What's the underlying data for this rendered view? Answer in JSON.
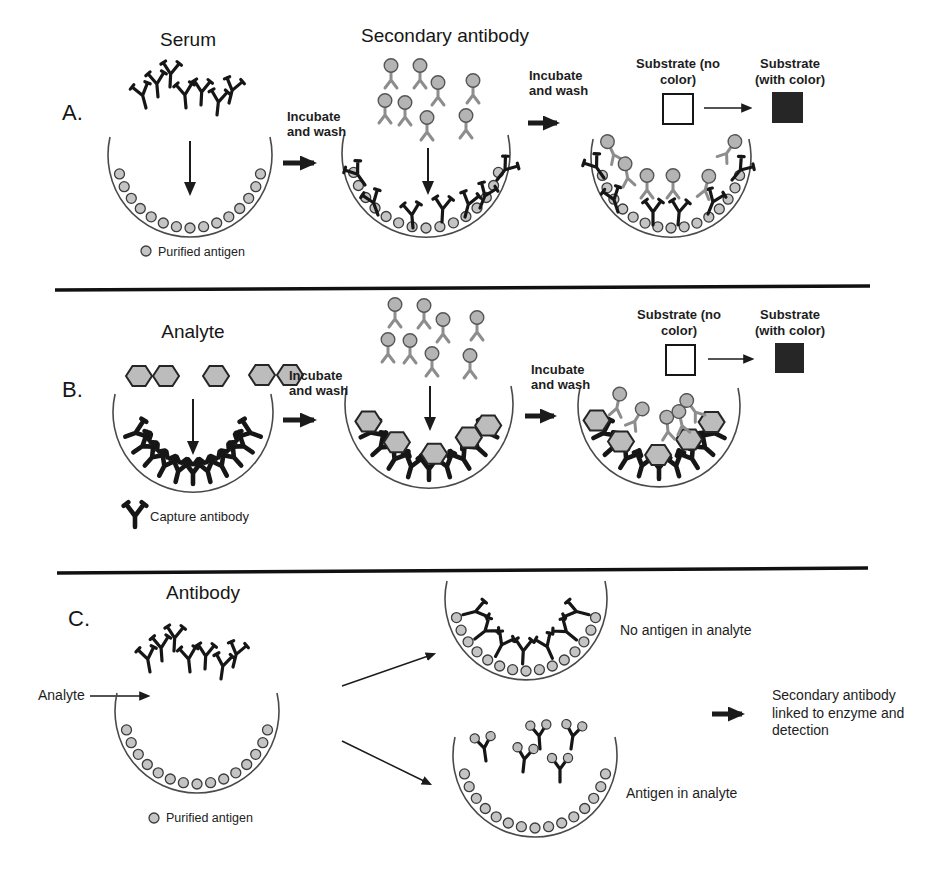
{
  "sections": {
    "a": {
      "label": "A.",
      "serum_title": "Serum",
      "secondary_antibody_title": "Secondary antibody",
      "incubate_wash_1": "Incubate and wash",
      "incubate_wash_2": "Incubate and wash",
      "substrate_no_color": "Substrate (no color)",
      "substrate_with_color": "Substrate (with color)",
      "legend_purified_antigen": "Purified antigen"
    },
    "b": {
      "label": "B.",
      "analyte_title": "Analyte",
      "incubate_wash_1": "Incubate and wash",
      "incubate_wash_2": "Incubate and wash",
      "substrate_no_color": "Substrate (no color)",
      "substrate_with_color": "Substrate (with color)",
      "legend_capture_antibody": "Capture antibody"
    },
    "c": {
      "label": "C.",
      "antibody_title": "Antibody",
      "analyte_label": "Analyte",
      "no_antigen_label": "No antigen in analyte",
      "antigen_label": "Antigen in analyte",
      "result_label": "Secondary antibody linked to enzyme and detection"
    }
  },
  "colors": {
    "background": "#ffffff",
    "ink": "#1d1d1d",
    "antibody_black": "#161616",
    "secondary_antibody_gray": "#8d8d8d",
    "enzyme_fill": "#b4b4b4",
    "antigen_fill": "#c4c4c4",
    "hexagon_fill": "#bcbcbc",
    "substrate_dark": "#262626"
  }
}
